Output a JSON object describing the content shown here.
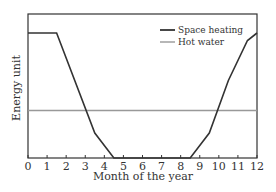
{
  "chart_data": {
    "type": "line",
    "title": "",
    "xlabel": "Month of the year",
    "ylabel": "Energy unit",
    "xlim": [
      0,
      12
    ],
    "ylim": [
      0,
      1
    ],
    "x_ticks": [
      "0",
      "1",
      "2",
      "3",
      "4",
      "5",
      "6",
      "7",
      "8",
      "9",
      "10",
      "11",
      "12"
    ],
    "y_ticks": [],
    "grid": false,
    "legend_position": "upper right",
    "series": [
      {
        "name": "Space heating",
        "color": "#333333",
        "x": [
          0,
          1.5,
          3.5,
          4.5,
          8.5,
          9.5,
          10.5,
          11.5,
          12
        ],
        "y": [
          1.0,
          1.0,
          0.2,
          0.0,
          0.0,
          0.2,
          0.62,
          0.94,
          1.0
        ]
      },
      {
        "name": "Hot water",
        "color": "#999999",
        "x": [
          0,
          12
        ],
        "y": [
          0.38,
          0.38
        ]
      }
    ]
  }
}
